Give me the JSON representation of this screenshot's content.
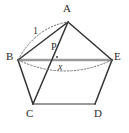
{
  "figure": {
    "type": "geometry-diagram",
    "background_color": "#ffffff",
    "stroke_color": "#333333",
    "light_stroke_color": "#9a9a9a",
    "dotted_stroke_color": "#777777",
    "width": 129,
    "height": 133
  },
  "vertices": [
    {
      "id": "A",
      "label": "A",
      "x": 68,
      "y": 22
    },
    {
      "id": "B",
      "label": "B",
      "x": 18,
      "y": 60
    },
    {
      "id": "C",
      "label": "C",
      "x": 33,
      "y": 104
    },
    {
      "id": "D",
      "label": "D",
      "x": 95,
      "y": 104
    },
    {
      "id": "E",
      "label": "E",
      "x": 112,
      "y": 60
    }
  ],
  "points": [
    {
      "id": "P",
      "label": "P",
      "x": 57,
      "y": 57
    }
  ],
  "edges": [
    {
      "id": "AB",
      "from": "A",
      "to": "B",
      "style": "solid",
      "color": "#333333"
    },
    {
      "id": "AE",
      "from": "A",
      "to": "E",
      "style": "solid",
      "color": "#333333"
    },
    {
      "id": "BC",
      "from": "B",
      "to": "C",
      "style": "solid",
      "color": "#333333"
    },
    {
      "id": "ED",
      "from": "E",
      "to": "D",
      "style": "solid",
      "color": "#333333"
    },
    {
      "id": "CD",
      "from": "C",
      "to": "D",
      "style": "solid",
      "color": "#9a9a9a"
    },
    {
      "id": "BE",
      "from": "B",
      "to": "E",
      "style": "solid",
      "color": "#9a9a9a"
    },
    {
      "id": "AC",
      "from": "A",
      "to": "C",
      "style": "solid",
      "color": "#333333"
    }
  ],
  "arcs": [
    {
      "id": "arc-AB",
      "from": "B",
      "to": "A",
      "style": "dotted",
      "bulge": "outward"
    },
    {
      "id": "arc-BE",
      "from": "B",
      "to": "E",
      "style": "dotted",
      "bulge": "downward"
    }
  ],
  "measure_labels": [
    {
      "id": "length-one",
      "text": "1",
      "target": "arc-AB"
    },
    {
      "id": "length-x",
      "text": "x",
      "target": "arc-BE"
    }
  ],
  "vertex_labels": {
    "A": "A",
    "B": "B",
    "C": "C",
    "D": "D",
    "E": "E",
    "P": "P"
  }
}
